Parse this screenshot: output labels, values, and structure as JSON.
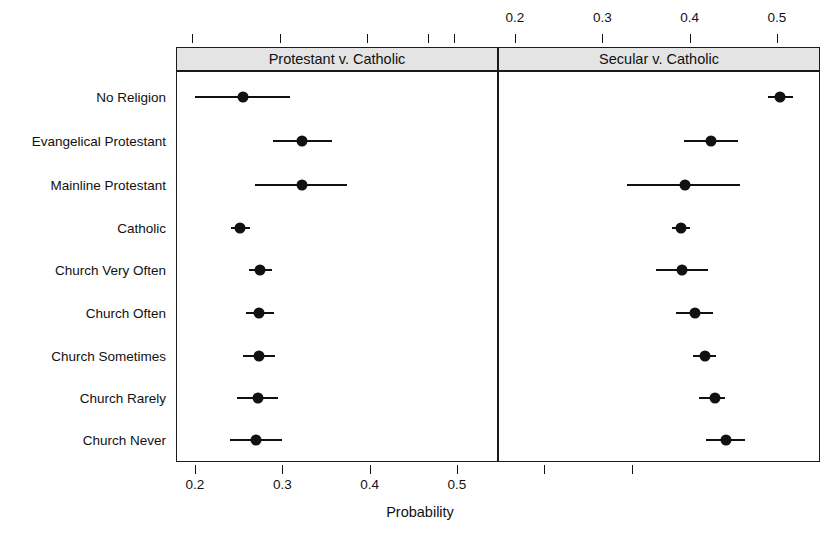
{
  "chart_data": {
    "type": "scatter",
    "title": "",
    "xlabel": "Probability",
    "ylabel": "",
    "xlim": [
      0.185,
      0.545
    ],
    "grid": false,
    "legend": null,
    "orientation": "horizontal",
    "marker": "filled-circle-with-error-bars",
    "categories": [
      "No Religion",
      "Evangelical Protestant",
      "Mainline Protestant",
      "Catholic",
      "Church Very Often",
      "Church Often",
      "Church Sometimes",
      "Church Rarely",
      "Church Never"
    ],
    "panels": [
      {
        "name": "panel-left",
        "label": "Protestant v. Catholic",
        "axis_position": "bottom",
        "ticks": [
          0.2,
          0.3,
          0.4,
          0.5
        ],
        "tick_labels": [
          "0.2",
          "0.3",
          "0.4",
          "0.5"
        ],
        "values": [
          0.255,
          0.323,
          0.322,
          0.252,
          0.274,
          0.273,
          0.273,
          0.272,
          0.27
        ],
        "ci_low": [
          0.2,
          0.289,
          0.269,
          0.241,
          0.262,
          0.258,
          0.255,
          0.248,
          0.24
        ],
        "ci_high": [
          0.309,
          0.357,
          0.374,
          0.263,
          0.288,
          0.29,
          0.292,
          0.295,
          0.3
        ]
      },
      {
        "name": "panel-right",
        "label": "Secular v. Catholic",
        "axis_position": "top",
        "ticks": [
          0.2,
          0.3,
          0.4,
          0.5
        ],
        "tick_labels": [
          "0.2",
          "0.3",
          "0.4",
          "0.5"
        ],
        "values": [
          0.504,
          0.425,
          0.395,
          0.39,
          0.391,
          0.406,
          0.418,
          0.429,
          0.442
        ],
        "ci_low": [
          0.49,
          0.394,
          0.328,
          0.38,
          0.362,
          0.384,
          0.404,
          0.411,
          0.419
        ],
        "ci_high": [
          0.519,
          0.455,
          0.458,
          0.4,
          0.421,
          0.427,
          0.43,
          0.441,
          0.464
        ]
      }
    ]
  },
  "axis": {
    "bottom_label": "Probability"
  }
}
